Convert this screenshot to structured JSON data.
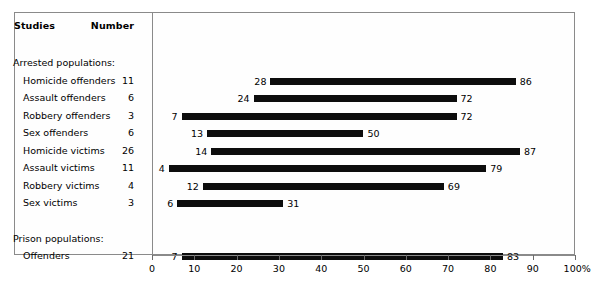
{
  "table": {
    "header": {
      "studies": "Studies",
      "number": "Number"
    },
    "groups": [
      {
        "title": "Arrested populations:",
        "rows": [
          {
            "label": "Homicide offenders",
            "number": "11",
            "low": 28,
            "high": 86,
            "low_label": "28",
            "high_label": "86"
          },
          {
            "label": "Assault offenders",
            "number": "6",
            "low": 24,
            "high": 72,
            "low_label": "24",
            "high_label": "72"
          },
          {
            "label": "Robbery offenders",
            "number": "3",
            "low": 7,
            "high": 72,
            "low_label": "7",
            "high_label": "72"
          },
          {
            "label": "Sex offenders",
            "number": "6",
            "low": 13,
            "high": 50,
            "low_label": "13",
            "high_label": "50"
          },
          {
            "label": "Homicide victims",
            "number": "26",
            "low": 14,
            "high": 87,
            "low_label": "14",
            "high_label": "87"
          },
          {
            "label": "Assault victims",
            "number": "11",
            "low": 4,
            "high": 79,
            "low_label": "4",
            "high_label": "79"
          },
          {
            "label": "Robbery victims",
            "number": "4",
            "low": 12,
            "high": 69,
            "low_label": "12",
            "high_label": "69"
          },
          {
            "label": "Sex victims",
            "number": "3",
            "low": 6,
            "high": 31,
            "low_label": "6",
            "high_label": "31"
          }
        ]
      },
      {
        "title": "Prison populations:",
        "rows": [
          {
            "label": "Offenders",
            "number": "21",
            "low": 7,
            "high": 83,
            "low_label": "7",
            "high_label": "83"
          }
        ]
      }
    ]
  },
  "axis": {
    "ticks": [
      "0",
      "10",
      "20",
      "30",
      "40",
      "50",
      "60",
      "70",
      "80",
      "90",
      "100%"
    ],
    "tick_values": [
      0,
      10,
      20,
      30,
      40,
      50,
      60,
      70,
      80,
      90,
      100
    ]
  },
  "colors": {
    "bar": "#0d0d0d",
    "frame": "#8a8a8a",
    "text": "#000000",
    "background": "#ffffff"
  },
  "chart_data": {
    "type": "bar",
    "subtype": "floating-range-bar",
    "title": "",
    "xlabel": "",
    "ylabel": "",
    "xlim": [
      0,
      100
    ],
    "xunit": "%",
    "grid": false,
    "legend": null,
    "categories": [
      "Homicide offenders",
      "Assault offenders",
      "Robbery offenders",
      "Sex offenders",
      "Homicide victims",
      "Assault victims",
      "Robbery victims",
      "Sex victims",
      "Offenders"
    ],
    "group_of_category": [
      "Arrested populations",
      "Arrested populations",
      "Arrested populations",
      "Arrested populations",
      "Arrested populations",
      "Arrested populations",
      "Arrested populations",
      "Arrested populations",
      "Prison populations"
    ],
    "series": [
      {
        "name": "Range low",
        "values": [
          28,
          24,
          7,
          13,
          14,
          4,
          12,
          6,
          7
        ]
      },
      {
        "name": "Range high",
        "values": [
          86,
          72,
          72,
          50,
          87,
          79,
          69,
          31,
          83
        ]
      }
    ],
    "number_of_studies": [
      11,
      6,
      3,
      6,
      26,
      11,
      4,
      3,
      21
    ],
    "xticks": [
      0,
      10,
      20,
      30,
      40,
      50,
      60,
      70,
      80,
      90,
      100
    ],
    "xticklabels": [
      "0",
      "10",
      "20",
      "30",
      "40",
      "50",
      "60",
      "70",
      "80",
      "90",
      "100%"
    ]
  }
}
